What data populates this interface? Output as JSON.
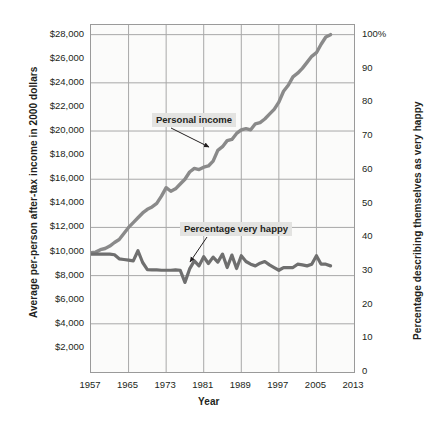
{
  "chart_data": {
    "type": "line",
    "title": "",
    "xlabel": "Year",
    "ylabel": "Average per-person after-tax income in 2000 dollars",
    "ylabel_right": "Percentage describing themselves as very happy",
    "xlim": [
      1957,
      2013
    ],
    "ylim_left": [
      0,
      28800
    ],
    "ylim_right": [
      0,
      103
    ],
    "grid": true,
    "legend_position": "inline-callouts",
    "x_ticks": [
      "1957",
      "1965",
      "1973",
      "1981",
      "1989",
      "1997",
      "2005",
      "2013"
    ],
    "x_tick_values": [
      1957,
      1965,
      1973,
      1981,
      1989,
      1997,
      2005,
      2013
    ],
    "y_ticks_left": [
      "$2,000",
      "$4,000",
      "$6,000",
      "$8,000",
      "$10,000",
      "$12,000",
      "$14,000",
      "$16,000",
      "$18,000",
      "$20,000",
      "$22,000",
      "$24,000",
      "$26,000",
      "$28,000"
    ],
    "y_tick_values_left": [
      2000,
      4000,
      6000,
      8000,
      10000,
      12000,
      14000,
      16000,
      18000,
      20000,
      22000,
      24000,
      26000,
      28000
    ],
    "y_ticks_right": [
      "0",
      "10",
      "20",
      "30",
      "40",
      "50",
      "60",
      "70",
      "80",
      "90",
      "100%"
    ],
    "y_tick_values_right": [
      0,
      10,
      20,
      30,
      40,
      50,
      60,
      70,
      80,
      90,
      100
    ],
    "annotations": [
      {
        "text": "Personal income",
        "x": 1973,
        "y": 21800
      },
      {
        "text": "Percentage very happy",
        "x": 1980,
        "y": 12400
      }
    ],
    "series": [
      {
        "name": "Personal income",
        "axis": "left",
        "color": "#8a8a8a",
        "x": [
          1957,
          1958,
          1959,
          1960,
          1961,
          1962,
          1963,
          1964,
          1965,
          1966,
          1967,
          1968,
          1969,
          1970,
          1971,
          1972,
          1973,
          1974,
          1975,
          1976,
          1977,
          1978,
          1979,
          1980,
          1981,
          1982,
          1983,
          1984,
          1985,
          1986,
          1987,
          1988,
          1989,
          1990,
          1991,
          1992,
          1993,
          1994,
          1995,
          1996,
          1997,
          1998,
          1999,
          2000,
          2001,
          2002,
          2003,
          2004,
          2005,
          2006,
          2007,
          2008
        ],
        "values": [
          9900,
          9950,
          10150,
          10250,
          10450,
          10750,
          11000,
          11500,
          12000,
          12400,
          12800,
          13200,
          13500,
          13700,
          14000,
          14600,
          15300,
          15000,
          15200,
          15600,
          16000,
          16600,
          16900,
          16800,
          17000,
          17100,
          17500,
          18400,
          18700,
          19200,
          19300,
          19800,
          20100,
          20200,
          20100,
          20600,
          20700,
          21000,
          21400,
          21800,
          22400,
          23300,
          23800,
          24500,
          24800,
          25200,
          25700,
          26200,
          26500,
          27200,
          27800,
          28000
        ]
      },
      {
        "name": "Percentage very happy",
        "axis": "right",
        "color": "#6f6f6f",
        "x": [
          1957,
          1958,
          1959,
          1960,
          1961,
          1962,
          1963,
          1964,
          1965,
          1966,
          1967,
          1968,
          1969,
          1970,
          1971,
          1972,
          1973,
          1974,
          1975,
          1976,
          1977,
          1978,
          1979,
          1980,
          1981,
          1982,
          1983,
          1984,
          1985,
          1986,
          1987,
          1988,
          1989,
          1990,
          1991,
          1992,
          1993,
          1994,
          1995,
          1996,
          1997,
          1998,
          1999,
          2000,
          2001,
          2002,
          2003,
          2004,
          2005,
          2006,
          2007,
          2008
        ],
        "values": [
          35.0,
          35.0,
          35.0,
          35.0,
          35.0,
          34.8,
          33.6,
          33.4,
          33.2,
          33.0,
          36.0,
          32.5,
          30.4,
          30.3,
          30.3,
          30.2,
          30.2,
          30.2,
          30.3,
          30.2,
          26.6,
          30.6,
          33.0,
          31.5,
          34.2,
          32.2,
          34.1,
          32.6,
          35.0,
          31.0,
          34.7,
          30.7,
          34.5,
          32.8,
          32.0,
          31.5,
          32.3,
          32.8,
          31.8,
          31.0,
          30.2,
          31.0,
          31.0,
          31.0,
          32.0,
          31.8,
          31.5,
          32.0,
          34.5,
          32.0,
          32.0,
          31.5
        ]
      }
    ]
  }
}
